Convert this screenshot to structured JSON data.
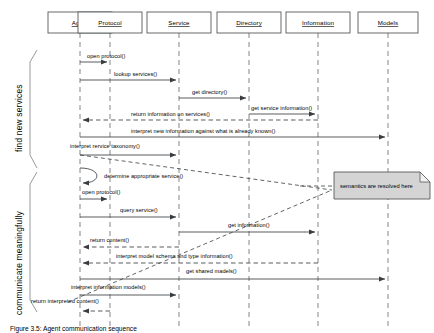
{
  "figure": {
    "caption": "Figure 3.5: Agent communication sequence"
  },
  "phases": [
    {
      "id": "find-new-services",
      "label": "find new services"
    },
    {
      "id": "communicate-meaningfully",
      "label": "communicate meaningfully"
    }
  ],
  "lifelines": [
    {
      "id": "agent",
      "label": "Agent",
      "x": 80,
      "box_x": 48,
      "box_w": 64
    },
    {
      "id": "protocol",
      "label": "Protocol",
      "x": 110,
      "box_x": 78,
      "box_w": 64
    },
    {
      "id": "service",
      "label": "Service",
      "x": 179,
      "box_x": 147,
      "box_w": 64
    },
    {
      "id": "directory",
      "label": "Directory",
      "x": 249,
      "box_x": 217,
      "box_w": 64
    },
    {
      "id": "information",
      "label": "Information",
      "x": 318,
      "box_x": 286,
      "box_w": 64
    },
    {
      "id": "models",
      "label": "Models",
      "x": 388,
      "box_x": 356,
      "box_w": 60
    }
  ],
  "messages": [
    {
      "id": "open-protocol-1",
      "label": "open protocol()",
      "from": "agent",
      "to": "protocol",
      "y": 56,
      "kind": "call"
    },
    {
      "id": "lookup-services",
      "label": "lookup services()",
      "from": "agent",
      "to": "service",
      "y": 74,
      "kind": "call"
    },
    {
      "id": "get-directory",
      "label": "get directory()",
      "from": "service",
      "to": "directory",
      "y": 92,
      "kind": "call"
    },
    {
      "id": "get-service-info",
      "label": "get service information()",
      "from": "directory",
      "to": "information",
      "y": 110,
      "kind": "call"
    },
    {
      "id": "return-info-services",
      "label": "return information on services()",
      "from": "information",
      "to": "agent",
      "y": 119,
      "kind": "return"
    },
    {
      "id": "interpret-new-info",
      "label": "interpret new information against what is already known()",
      "from": "agent",
      "to": "models",
      "y": 136,
      "kind": "call"
    },
    {
      "id": "interpret-taxonomy",
      "label": "interpret rervice taxonomy()",
      "from": "agent",
      "to": "service",
      "y": 154,
      "kind": "call"
    },
    {
      "id": "determine-service",
      "label": "determine appropriate service()",
      "from": "agent",
      "to": "agent",
      "y": 176,
      "kind": "self"
    },
    {
      "id": "open-protocol-2",
      "label": "open protocol()",
      "from": "agent",
      "to": "protocol",
      "y": 198,
      "kind": "call"
    },
    {
      "id": "query-service",
      "label": "query service()",
      "from": "agent",
      "to": "service",
      "y": 216,
      "kind": "call"
    },
    {
      "id": "get-information",
      "label": "get information()",
      "from": "service",
      "to": "information",
      "y": 232,
      "kind": "call"
    },
    {
      "id": "return-content",
      "label": "return content()",
      "from": "service",
      "to": "agent",
      "y": 245,
      "kind": "return"
    },
    {
      "id": "interpret-model-schema",
      "label": "interpret model schema and type information()",
      "from": "information",
      "to": "agent",
      "y": 262,
      "kind": "return"
    },
    {
      "id": "get-shared-models",
      "label": "get shared madels()",
      "from": "agent",
      "to": "models",
      "y": 278,
      "kind": "call"
    },
    {
      "id": "interpret-info-models",
      "label": "interpret information models()",
      "from": "agent",
      "to": "service",
      "y": 291,
      "kind": "call"
    },
    {
      "id": "return-interpreted",
      "label": "return interpreted content()",
      "from": "protocol",
      "to": "agent",
      "y": 306,
      "kind": "return"
    }
  ],
  "note": {
    "id": "semantics-note",
    "text": "semantics are resolved here",
    "x": 334,
    "y": 172,
    "w": 96,
    "h": 27
  },
  "colors": {
    "stroke": "#3a3d40",
    "lifeline": "#8d9194",
    "note_fill": "#d4d4d4",
    "box_fill": "#ffffff",
    "background": "#ffffff"
  }
}
